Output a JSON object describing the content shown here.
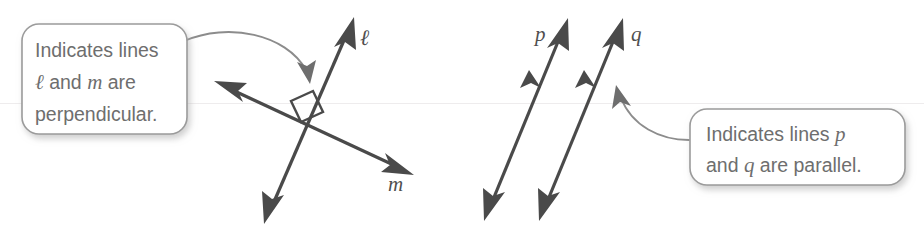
{
  "figure": {
    "background_color": "#ffffff",
    "stroke_color": "#4a4a4a",
    "callout_text_color": "#6e6e6e",
    "callout_border_color": "#9b9b9b",
    "leader_color": "#8c8c8c"
  },
  "callouts": {
    "perpendicular": {
      "line1_prefix": "Indicates lines",
      "line2_symbol": "ℓ",
      "line2_mid": " and ",
      "line2_var": "m",
      "line2_suffix": " are",
      "line3": "perpendicular.",
      "full_text": "Indicates lines ℓ and m are perpendicular."
    },
    "parallel": {
      "line1_prefix": "Indicates lines ",
      "line1_var": "p",
      "line2_prefix": "and ",
      "line2_var": "q",
      "line2_suffix": " are parallel.",
      "full_text": "Indicates lines p and q are parallel."
    }
  },
  "diagram_left": {
    "name": "perpendicular-lines-diagram",
    "line_labels": {
      "line_l": "ℓ",
      "line_m": "m"
    },
    "right_angle_marker": true
  },
  "diagram_right": {
    "name": "parallel-lines-diagram",
    "line_labels": {
      "line_p": "p",
      "line_q": "q"
    },
    "parallel_tick_marks": 2
  }
}
